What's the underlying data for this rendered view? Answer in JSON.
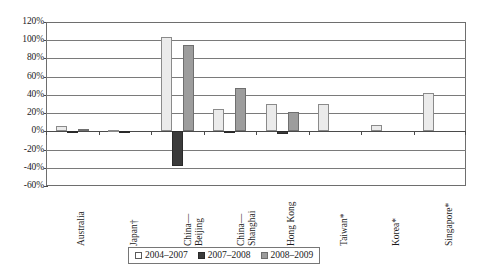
{
  "chart_data": {
    "type": "bar",
    "title": "",
    "subtitle": "",
    "xlabel": "",
    "ylabel": "",
    "ylim": [
      -60,
      120
    ],
    "ytick_labels": [
      "120%",
      "100%",
      "80%",
      "60%",
      "40%",
      "20%",
      "0%",
      "-20%",
      "-40%",
      "-60%"
    ],
    "ytick_values": [
      120,
      100,
      80,
      60,
      40,
      20,
      0,
      -20,
      -40,
      -60
    ],
    "grid": true,
    "legend_position": "bottom",
    "categories": [
      "Australia",
      "Japan†",
      "China—Beijing",
      "China—Shanghai",
      "Hong Kong",
      "Taiwan*",
      "Korea*",
      "Singapore*"
    ],
    "category_lines": [
      [
        "Australia"
      ],
      [
        "Japan†"
      ],
      [
        "China—",
        "Beijing"
      ],
      [
        "China—",
        "Shanghai"
      ],
      [
        "Hong Kong"
      ],
      [
        "Taiwan*"
      ],
      [
        "Korea*"
      ],
      [
        "Singapore*"
      ]
    ],
    "series": [
      {
        "name": "2004–2007",
        "color": "#ebebeb",
        "values": [
          6,
          1,
          103,
          25,
          30,
          30,
          7,
          42
        ]
      },
      {
        "name": "2007–2008",
        "color": "#3b3b3b",
        "values": [
          -2,
          -2,
          -38,
          -2,
          -3,
          0,
          0,
          0
        ]
      },
      {
        "name": "2008–2009",
        "color": "#9d9d9d",
        "values": [
          3,
          0,
          95,
          48,
          21,
          0,
          0,
          0
        ]
      }
    ]
  },
  "legend": {
    "items": [
      {
        "label": "2004–2007",
        "swatch": "legend-swatch-2004-2007"
      },
      {
        "label": "2007–2008",
        "swatch": "legend-swatch-2007-2008"
      },
      {
        "label": "2008–2009",
        "swatch": "legend-swatch-2008-2009"
      }
    ]
  },
  "colors": {
    "series_2004_2007": "#ebebeb",
    "series_2007_2008": "#3b3b3b",
    "series_2008_2009": "#9d9d9d",
    "axis": "#4a4a4a",
    "grid": "#7a7a7a",
    "background": "#ffffff"
  }
}
